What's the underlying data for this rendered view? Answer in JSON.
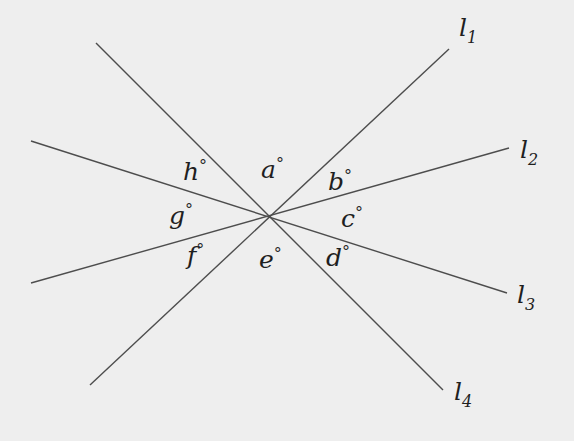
{
  "diagram": {
    "type": "intersecting-lines",
    "intersection_point": [
      268,
      217
    ],
    "colors": {
      "background": "#eeeeee",
      "line": "#4d4d4d",
      "text": "#1f1f1f"
    },
    "lines": [
      {
        "id": "l1",
        "name": "l",
        "subscript": "1",
        "from": [
          90,
          385
        ],
        "to": [
          449,
          49
        ],
        "label_pos": [
          459,
          36
        ],
        "sub_pos": [
          469,
          43
        ]
      },
      {
        "id": "l2",
        "name": "l",
        "subscript": "2",
        "from": [
          31,
          283
        ],
        "to": [
          509,
          148
        ],
        "label_pos": [
          520,
          158
        ],
        "sub_pos": [
          530,
          165
        ]
      },
      {
        "id": "l3",
        "name": "l",
        "subscript": "3",
        "from": [
          31,
          141
        ],
        "to": [
          507,
          293
        ],
        "label_pos": [
          517,
          303
        ],
        "sub_pos": [
          527,
          310
        ]
      },
      {
        "id": "l4",
        "name": "l",
        "subscript": "4",
        "from": [
          96,
          43
        ],
        "to": [
          443,
          390
        ],
        "label_pos": [
          454,
          400
        ],
        "sub_pos": [
          464,
          408
        ]
      }
    ],
    "angles": [
      {
        "id": "a",
        "label": "a",
        "unit": "°",
        "pos": [
          261,
          178
        ]
      },
      {
        "id": "b",
        "label": "b",
        "unit": "°",
        "pos": [
          328,
          190
        ]
      },
      {
        "id": "c",
        "label": "c",
        "unit": "°",
        "pos": [
          341,
          227
        ]
      },
      {
        "id": "d",
        "label": "d",
        "unit": "°",
        "pos": [
          326,
          266
        ]
      },
      {
        "id": "e",
        "label": "e",
        "unit": "°",
        "pos": [
          259,
          268
        ]
      },
      {
        "id": "f",
        "label": "f",
        "unit": "°",
        "pos": [
          187,
          264
        ]
      },
      {
        "id": "g",
        "label": "g",
        "unit": "°",
        "pos": [
          169,
          224
        ]
      },
      {
        "id": "h",
        "label": "h",
        "unit": "°",
        "pos": [
          183,
          180
        ]
      }
    ]
  }
}
